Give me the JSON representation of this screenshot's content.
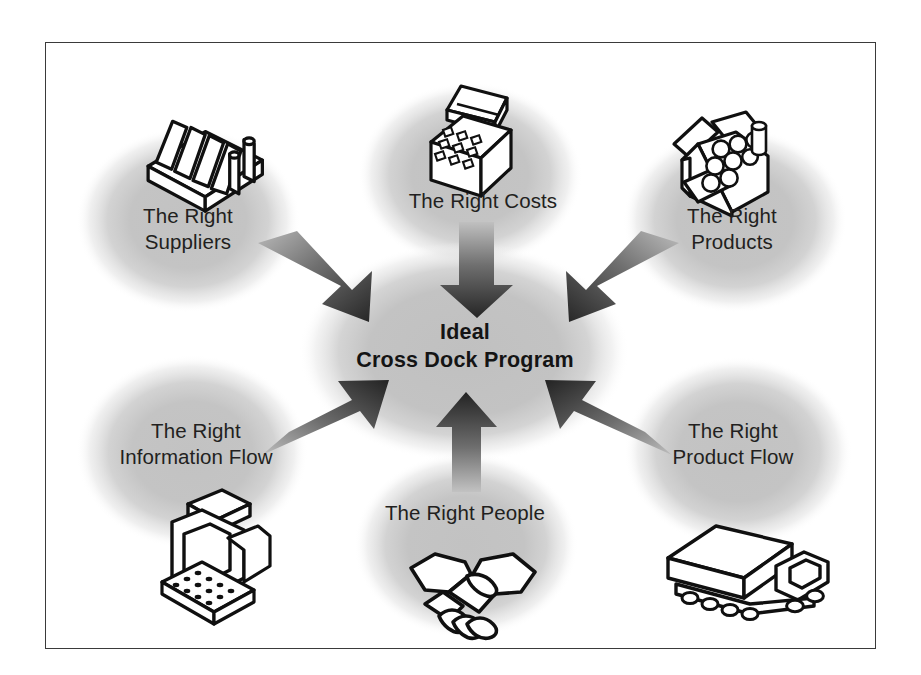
{
  "diagram": {
    "title": "Ideal Cross Dock Program",
    "center": {
      "line1": "Ideal",
      "line2": "Cross Dock Program",
      "text": "Ideal\nCross Dock Program"
    },
    "nodes": [
      {
        "id": "suppliers",
        "label": "The Right\nSuppliers",
        "icon": "factory-icon",
        "position": "top-left",
        "icon_position": "above-label"
      },
      {
        "id": "costs",
        "label": "The Right Costs",
        "icon": "cash-register-icon",
        "position": "top-center",
        "icon_position": "above-label"
      },
      {
        "id": "products",
        "label": "The Right\nProducts",
        "icon": "open-box-of-goods-icon",
        "position": "top-right",
        "icon_position": "above-label"
      },
      {
        "id": "information-flow",
        "label": "The Right\nInformation Flow",
        "icon": "desktop-computer-icon",
        "position": "bottom-left",
        "icon_position": "below-label"
      },
      {
        "id": "people",
        "label": "The Right People",
        "icon": "handshake-icon",
        "position": "bottom-center",
        "icon_position": "below-label"
      },
      {
        "id": "product-flow",
        "label": "The Right\nProduct Flow",
        "icon": "delivery-truck-icon",
        "position": "bottom-right",
        "icon_position": "below-label"
      }
    ],
    "arrows": [
      {
        "id": "arrow-suppliers-to-center",
        "from": "suppliers",
        "to": "center",
        "direction": "down-right"
      },
      {
        "id": "arrow-costs-to-center",
        "from": "costs",
        "to": "center",
        "direction": "down"
      },
      {
        "id": "arrow-products-to-center",
        "from": "products",
        "to": "center",
        "direction": "down-left"
      },
      {
        "id": "arrow-information-to-center",
        "from": "information-flow",
        "to": "center",
        "direction": "up-right"
      },
      {
        "id": "arrow-people-to-center",
        "from": "people",
        "to": "center",
        "direction": "up"
      },
      {
        "id": "arrow-productflow-to-center",
        "from": "product-flow",
        "to": "center",
        "direction": "up-left"
      }
    ],
    "colors": {
      "background": "#ffffff",
      "frame_border": "#3a3a3a",
      "blob_fill": "#c4c4c4",
      "center_blob_fill": "#c2c2c2",
      "arrow_dark": "#2b2b2b",
      "arrow_light": "#8d8d8d",
      "label_text": "#221f20",
      "center_text": "#141414",
      "icon_outline": "#101010",
      "icon_fill": "#ffffff"
    }
  }
}
